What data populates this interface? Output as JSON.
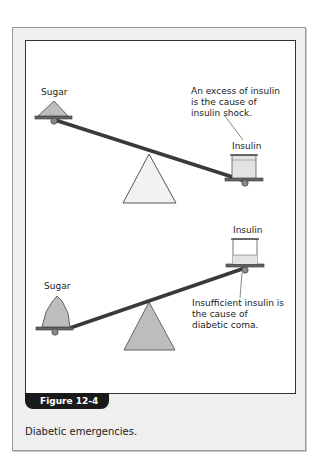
{
  "top_seesaw": {
    "left_label": "Sugar",
    "right_label": "Insulin",
    "note": "An excess of insulin is the cause of insulin shock."
  },
  "bottom_seesaw": {
    "left_label": "Sugar",
    "right_label": "Insulin",
    "note": "Insufficient insulin is the cause of diabetic coma."
  },
  "figure": {
    "tab_label": "Figure 12-4",
    "caption": "Diabetic emergencies."
  },
  "colors": {
    "panel_bg": "#efefef",
    "tab_bg": "#1a1a1a",
    "fulcrum_top": "#f2f2f2",
    "fulcrum_bottom": "#bdbdbd",
    "beam": "#3a3a3a"
  }
}
